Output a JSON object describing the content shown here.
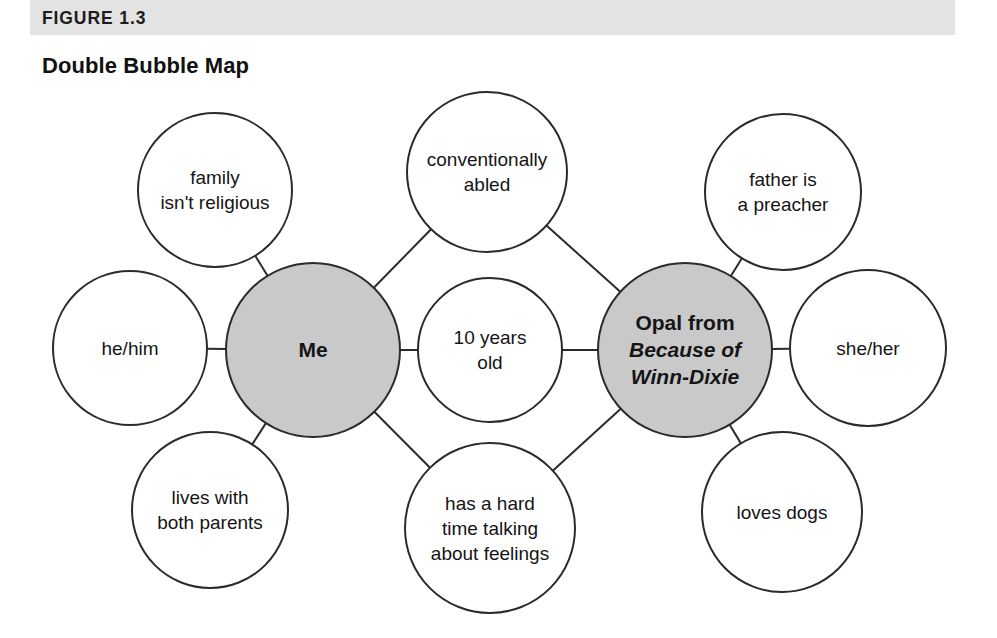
{
  "figure": {
    "label": "FIGURE 1.3",
    "title": "Double Bubble Map"
  },
  "colors": {
    "header_band": "#e3e3e3",
    "center_bubble_fill": "#c9c9c9",
    "outline": "#2b2b2b",
    "text": "#151515",
    "page_background": "#ffffff"
  },
  "diagram": {
    "type": "double-bubble-map",
    "centers": [
      {
        "id": "left-center",
        "lines": [
          "Me"
        ],
        "cx": 313,
        "cy": 350,
        "r": 87,
        "filled": true,
        "style": [
          "bold"
        ]
      },
      {
        "id": "right-center",
        "lines": [
          "Opal from",
          "Because of",
          "Winn-Dixie"
        ],
        "cx": 685,
        "cy": 350,
        "r": 87,
        "filled": true,
        "style": [
          "bold",
          "bold-italic",
          "bold-italic"
        ]
      }
    ],
    "shared": [
      {
        "id": "shared-top",
        "lines": [
          "conventionally",
          "abled"
        ],
        "cx": 487,
        "cy": 172,
        "r": 80
      },
      {
        "id": "shared-middle",
        "lines": [
          "10 years",
          "old"
        ],
        "cx": 490,
        "cy": 350,
        "r": 72
      },
      {
        "id": "shared-bottom",
        "lines": [
          "has a hard",
          "time talking",
          "about feelings"
        ],
        "cx": 490,
        "cy": 528,
        "r": 85
      }
    ],
    "left_outer": [
      {
        "id": "left-top",
        "lines": [
          "family",
          "isn't religious"
        ],
        "cx": 215,
        "cy": 190,
        "r": 77
      },
      {
        "id": "left-middle",
        "lines": [
          "he/him"
        ],
        "cx": 130,
        "cy": 348,
        "r": 77
      },
      {
        "id": "left-bottom",
        "lines": [
          "lives with",
          "both parents"
        ],
        "cx": 210,
        "cy": 510,
        "r": 78
      }
    ],
    "right_outer": [
      {
        "id": "right-top",
        "lines": [
          "father is",
          "a preacher"
        ],
        "cx": 783,
        "cy": 192,
        "r": 78
      },
      {
        "id": "right-middle",
        "lines": [
          "she/her"
        ],
        "cx": 868,
        "cy": 348,
        "r": 78
      },
      {
        "id": "right-bottom",
        "lines": [
          "loves dogs"
        ],
        "cx": 782,
        "cy": 512,
        "r": 80
      }
    ]
  }
}
